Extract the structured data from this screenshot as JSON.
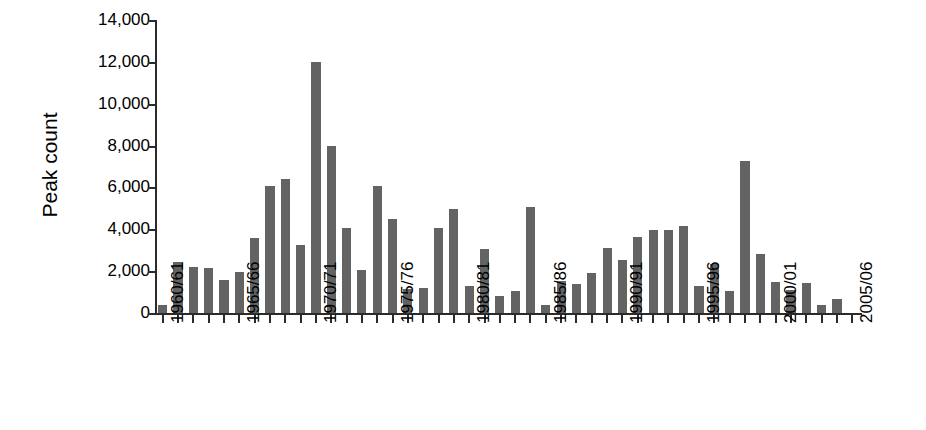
{
  "chart_data": {
    "type": "bar",
    "title": "",
    "xlabel": "",
    "ylabel": "Peak count",
    "ylim": [
      0,
      14000
    ],
    "yticks": [
      0,
      2000,
      4000,
      6000,
      8000,
      10000,
      12000,
      14000
    ],
    "ytick_labels": [
      "0",
      "2,000",
      "4,000",
      "6,000",
      "8,000",
      "10,000",
      "12,000",
      "14,000"
    ],
    "grid": false,
    "legend": null,
    "bar_color": "#636363",
    "axis_color": "#2b2b2b",
    "categories": [
      "1960/61",
      "1961/62",
      "1962/63",
      "1963/64",
      "1964/65",
      "1965/66",
      "1966/67",
      "1967/68",
      "1968/69",
      "1969/70",
      "1970/71",
      "1971/72",
      "1972/73",
      "1973/74",
      "1974/75",
      "1975/76",
      "1976/77",
      "1977/78",
      "1978/79",
      "1979/80",
      "1980/81",
      "1981/82",
      "1982/83",
      "1983/84",
      "1984/85",
      "1985/86",
      "1986/87",
      "1987/88",
      "1988/89",
      "1989/90",
      "1990/91",
      "1991/92",
      "1992/93",
      "1993/94",
      "1994/95",
      "1995/96",
      "1996/97",
      "1997/98",
      "1998/99",
      "1999/00",
      "2000/01",
      "2001/02",
      "2002/03",
      "2003/04",
      "2004/05",
      "2005/06"
    ],
    "values": [
      400,
      2450,
      2200,
      2150,
      1600,
      1950,
      3600,
      6050,
      6400,
      3250,
      12000,
      8000,
      4050,
      2050,
      6050,
      4500,
      1150,
      1200,
      4050,
      4950,
      1300,
      3050,
      800,
      1050,
      5050,
      400,
      1550,
      1400,
      1900,
      3100,
      2550,
      3650,
      3950,
      3950,
      4150,
      1300,
      2350,
      1050,
      7250,
      2800,
      1500,
      1100,
      1450,
      400,
      650,
      0
    ],
    "xtick_labels": [
      "1960/61",
      "1965/66",
      "1970/71",
      "1975/76",
      "1980/81",
      "1985/86",
      "1990/91",
      "1995/96",
      "2000/01",
      "2005/06"
    ],
    "xtick_indices": [
      0,
      5,
      10,
      15,
      20,
      25,
      30,
      35,
      40,
      45
    ]
  }
}
